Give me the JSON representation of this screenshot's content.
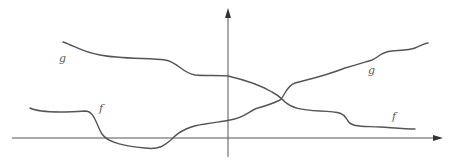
{
  "diagram": {
    "colors": {
      "stroke": "#555555",
      "arrow": "#333333",
      "background": "#ffffff"
    },
    "axes": {
      "x_axis": {
        "from": [
          12,
          138
        ],
        "to": [
          442,
          138
        ],
        "arrow": "right"
      },
      "y_axis": {
        "from": [
          228,
          157
        ],
        "to": [
          228,
          8
        ],
        "arrow": "up"
      }
    },
    "curves": [
      {
        "id": "curve-upper-left",
        "path": "M63,42 C75,46 82,52 100,55 C120,59 150,58 165,60 C178,62 182,73 195,75 C205,76 220,75 228,76 C245,80 262,86 272,92 C280,96 282,99 285,102 C292,108 300,110 320,111 C345,112 343,114 348,121 C352,127 360,126 380,127 C395,128 405,129 415,129"
      },
      {
        "id": "curve-lower-left",
        "path": "M30,108 C40,113 70,112 85,111 C95,111 96,125 102,134 C108,143 125,146 145,148 C160,150 165,145 172,139 C180,130 190,126 205,124 C215,122 222,122 230,120 C245,118 250,110 258,108 C265,106 272,104 280,100 C285,96 286,86 295,83 C310,79 325,76 345,68 C360,64 365,62 372,60 C378,58 380,52 392,51 C405,50 410,50 415,48 C420,46 425,43 428,43"
      }
    ],
    "labels": [
      {
        "text": "g",
        "x": 59,
        "y": 53
      },
      {
        "text": "f",
        "x": 99,
        "y": 103
      },
      {
        "text": "g",
        "x": 368,
        "y": 65
      },
      {
        "text": "f",
        "x": 392,
        "y": 111
      }
    ]
  }
}
